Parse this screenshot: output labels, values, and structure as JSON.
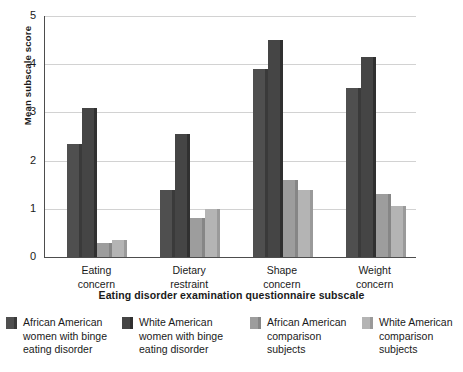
{
  "chart_data": {
    "type": "bar",
    "title": "",
    "xlabel": "Eating disorder examination questionnaire subscale",
    "ylabel": "Mean subscale score",
    "ylim": [
      0,
      5
    ],
    "yticks": [
      0,
      1,
      2,
      3,
      4,
      5
    ],
    "ytick_labels": [
      "0",
      "1",
      "2",
      "3",
      "4",
      "5"
    ],
    "grid": "horizontal",
    "legend_position": "bottom",
    "categories": [
      "Eating concern",
      "Dietary restraint",
      "Shape concern",
      "Weight concern"
    ],
    "category_lines": [
      [
        "Eating",
        "concern"
      ],
      [
        "Dietary",
        "restraint"
      ],
      [
        "Shape",
        "concern"
      ],
      [
        "Weight",
        "concern"
      ]
    ],
    "series": [
      {
        "name": "African American women with binge eating disorder",
        "name_lines": [
          "African American",
          "women with binge",
          "eating disorder"
        ],
        "color": "#4f4f4f",
        "side_color": "#3a3a3a",
        "values": [
          2.35,
          1.4,
          3.9,
          3.5
        ]
      },
      {
        "name": "White American women with binge eating disorder",
        "name_lines": [
          "White American",
          "women with binge",
          "eating disorder"
        ],
        "color": "#454545",
        "side_color": "#303030",
        "values": [
          3.1,
          2.55,
          4.5,
          4.15
        ]
      },
      {
        "name": "African American comparison subjects",
        "name_lines": [
          "African American",
          "comparison",
          "subjects"
        ],
        "color": "#9d9d9d",
        "side_color": "#868686",
        "values": [
          0.3,
          0.8,
          1.6,
          1.3
        ]
      },
      {
        "name": "White American comparison subjects",
        "name_lines": [
          "White American",
          "comparison",
          "subjects"
        ],
        "color": "#b4b4b4",
        "side_color": "#9a9a9a",
        "values": [
          0.35,
          1.0,
          1.4,
          1.05
        ]
      }
    ]
  },
  "axes": {
    "y_title": "Mean subscale score",
    "x_title": "Eating disorder examination questionnaire subscale"
  }
}
